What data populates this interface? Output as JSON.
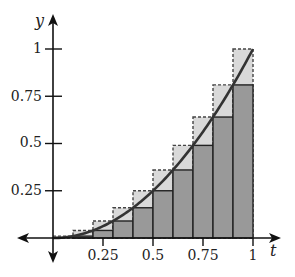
{
  "chart_data": {
    "type": "bar",
    "title": "",
    "xlabel": "t",
    "ylabel": "y",
    "xlim": [
      0,
      1
    ],
    "ylim": [
      0,
      1
    ],
    "x_ticks": [
      0.25,
      0.5,
      0.75,
      1
    ],
    "x_tick_labels": [
      "0.25",
      "0.5",
      "0.75",
      "1"
    ],
    "y_ticks": [
      0.25,
      0.5,
      0.75,
      1
    ],
    "y_tick_labels": [
      "0.25",
      "0.5",
      "0.75",
      "1"
    ],
    "grid": false,
    "legend": null,
    "curve": {
      "function": "t^2",
      "color": "#333333"
    },
    "intervals": [
      [
        0,
        0.1
      ],
      [
        0.1,
        0.2
      ],
      [
        0.2,
        0.3
      ],
      [
        0.3,
        0.4
      ],
      [
        0.4,
        0.5
      ],
      [
        0.5,
        0.6
      ],
      [
        0.6,
        0.7
      ],
      [
        0.7,
        0.8
      ],
      [
        0.8,
        0.9
      ],
      [
        0.9,
        1.0
      ]
    ],
    "series": [
      {
        "name": "lower sum (left endpoints)",
        "style": "solid dark gray",
        "color": "#999999",
        "values": [
          0,
          0.01,
          0.04,
          0.09,
          0.16,
          0.25,
          0.36,
          0.49,
          0.64,
          0.81
        ]
      },
      {
        "name": "upper sum (right endpoints)",
        "style": "dashed light gray",
        "color": "#d9d9d9",
        "values": [
          0.01,
          0.04,
          0.09,
          0.16,
          0.25,
          0.36,
          0.49,
          0.64,
          0.81,
          1.0
        ]
      }
    ]
  },
  "labels": {
    "x_axis": "t",
    "y_axis": "y",
    "x_ticks": [
      "0.25",
      "0.5",
      "0.75",
      "1"
    ],
    "y_ticks": [
      "0.25",
      "0.5",
      "0.75",
      "1"
    ]
  }
}
